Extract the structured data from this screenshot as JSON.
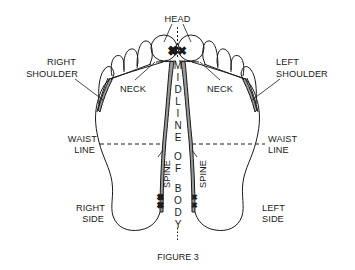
{
  "figure": {
    "caption": "FIGURE 3",
    "labels": {
      "head": "HEAD",
      "right_shoulder_1": "RIGHT",
      "right_shoulder_2": "SHOULDER",
      "left_shoulder_1": "LEFT",
      "left_shoulder_2": "SHOULDER",
      "neck_right": "NECK",
      "neck_left": "NECK",
      "waist_right_1": "WAIST",
      "waist_right_2": "LINE",
      "waist_left_1": "WAIST",
      "waist_left_2": "LINE",
      "spine_right": "SPINE",
      "spine_left": "SPINE",
      "side_right_1": "RIGHT",
      "side_right_2": "SIDE",
      "side_left_1": "LEFT",
      "side_left_2": "SIDE"
    },
    "midline_letters": [
      "M",
      "I",
      "D",
      "L",
      "I",
      "N",
      "E",
      "O",
      "F",
      "B",
      "O",
      "D",
      "Y"
    ],
    "colors": {
      "ink": "#1a1a1a",
      "band_fill": "#9a9a9a",
      "background": "#ffffff"
    }
  }
}
